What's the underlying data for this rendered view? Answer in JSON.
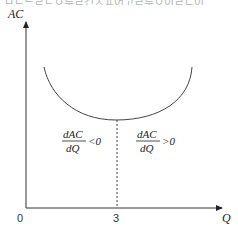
{
  "header": {
    "clipped_text": "ㅁㄴ드ㄹㄴㅇ루ㄹ건ㅈㅍ어고ㄹ루ㅇ이ㄹㄷ이"
  },
  "diagram": {
    "y_axis_label": "AC",
    "x_axis_label": "Q",
    "origin_label": "0",
    "x_tick_label": "3",
    "left_region": {
      "numerator": "dAC",
      "denominator": "dQ",
      "relation": "<0"
    },
    "right_region": {
      "numerator": "dAC",
      "denominator": "dQ",
      "relation": ">0"
    },
    "curve": "U-shaped average cost curve with minimum at Q = 3"
  }
}
